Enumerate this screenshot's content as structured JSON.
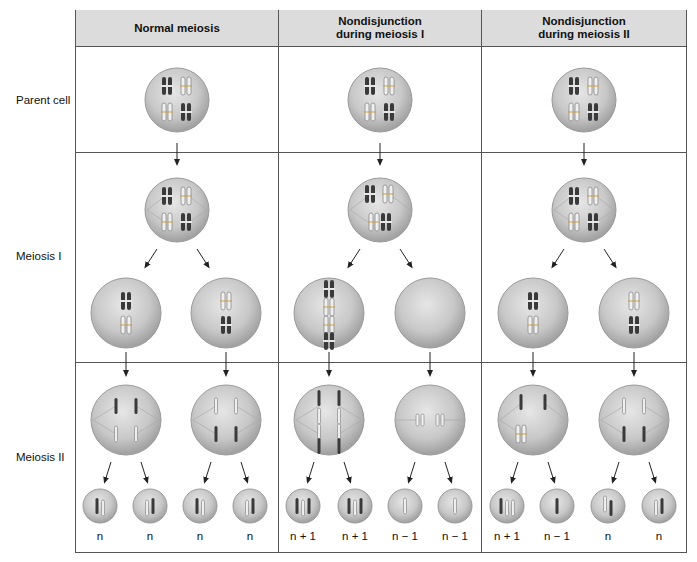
{
  "figure": {
    "type": "meiosis-nondisjunction-comparison-table",
    "columns": [
      {
        "id": "normal",
        "label": "Normal meiosis"
      },
      {
        "id": "nd1",
        "label_line1": "Nondisjunction",
        "label_line2": "during meiosis I"
      },
      {
        "id": "nd2",
        "label_line1": "Nondisjunction",
        "label_line2": "during meiosis II"
      }
    ],
    "rows": [
      {
        "id": "parent",
        "label": "Parent cell"
      },
      {
        "id": "meiosis1",
        "label": "Meiosis I"
      },
      {
        "id": "meiosis2",
        "label": "Meiosis II"
      }
    ],
    "gametes": {
      "normal": [
        "n",
        "n",
        "n",
        "n"
      ],
      "nd1": [
        "n + 1",
        "n + 1",
        "n − 1",
        "n − 1"
      ],
      "nd2": [
        "n + 1",
        "n − 1",
        "n",
        "n"
      ]
    },
    "colors": {
      "header_bg": "#dcdcdc",
      "grid_line": "#555555",
      "cell_fill": "#c9c9c9",
      "cell_rim": "#9a9a9a",
      "chromosome_dark": "#3a3a3a",
      "chromosome_light": "#9c9c9c"
    }
  }
}
